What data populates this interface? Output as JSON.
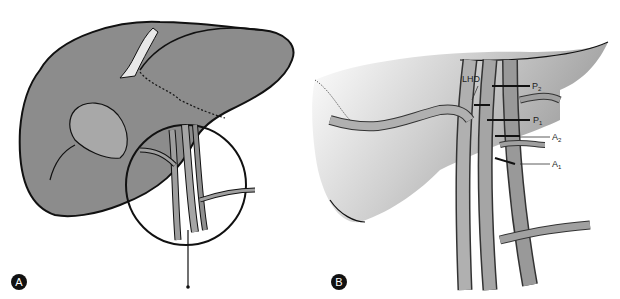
{
  "figure": {
    "panels": [
      {
        "id": "A",
        "badge": "A",
        "description": "Liver with hilar region circled showing biliary and vascular structures"
      },
      {
        "id": "B",
        "badge": "B",
        "description": "Magnified view of hepatic hilum with ducts and vessels",
        "labels": [
          {
            "key": "LHD",
            "text": "LHD"
          },
          {
            "key": "P2",
            "text": "P",
            "sub": "2"
          },
          {
            "key": "P1",
            "text": "P",
            "sub": "1"
          },
          {
            "key": "A2",
            "text": "A",
            "sub": "2"
          },
          {
            "key": "A1",
            "text": "A",
            "sub": "1"
          }
        ]
      }
    ],
    "colors": {
      "organ": "#8c8c8c",
      "organ_light": "#bdbdbd",
      "outline": "#111111",
      "vessel": "#a9a9a9"
    }
  }
}
